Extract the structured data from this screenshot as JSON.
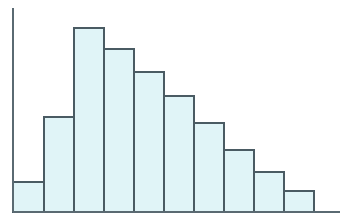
{
  "figure": {
    "width": 344,
    "height": 222,
    "background": "#ffffff"
  },
  "style": {
    "bar_fill": "#e0f4f7",
    "bar_stroke": "#4a5b63",
    "axis_color": "#5a6a72",
    "bar_stroke_width": 1.6,
    "axis_stroke_width": 1.6
  },
  "axes": {
    "y_axis": {
      "x": 13,
      "y_top": 8,
      "y_bottom": 212,
      "visible": true
    },
    "x_axis": {
      "y": 212,
      "x_left": 13,
      "x_right": 340,
      "visible": true
    },
    "tick_labels_visible": false,
    "grid": false
  },
  "chart_data": {
    "type": "bar",
    "title": "",
    "subtitle": "",
    "xlabel": "",
    "ylabel": "",
    "categories": [
      "1",
      "2",
      "3",
      "4",
      "5",
      "6",
      "7",
      "8",
      "9",
      "10"
    ],
    "values": [
      30,
      95,
      184,
      163,
      140,
      116,
      89,
      62,
      40,
      21
    ],
    "bar_tops_px": [
      182,
      117,
      28,
      49,
      72,
      96,
      123,
      150,
      172,
      191
    ],
    "bar_edges_px": [
      13,
      44,
      74,
      104,
      134,
      164,
      194,
      224,
      254,
      284,
      314
    ],
    "baseline_px": 212,
    "bar_width_px": 30,
    "xlim": [
      13,
      314
    ],
    "ylim": [
      0,
      204
    ],
    "legend": [],
    "legend_position": "none",
    "annotations": [],
    "grid": false,
    "orientation": "vertical"
  }
}
